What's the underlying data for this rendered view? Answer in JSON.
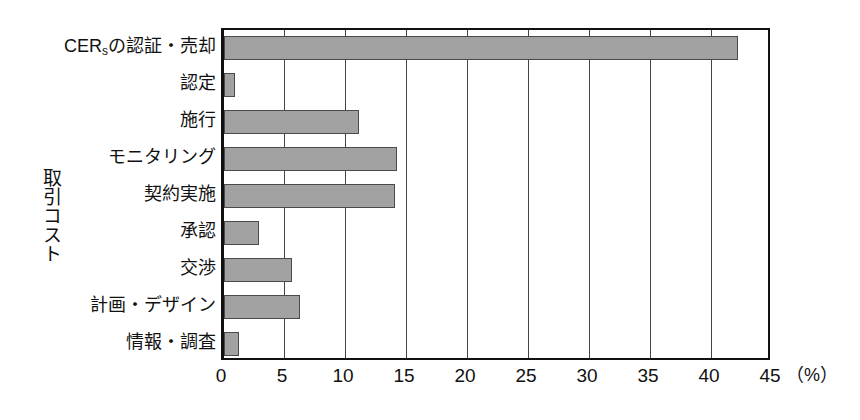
{
  "chart_data": {
    "type": "bar",
    "orientation": "horizontal",
    "title": "",
    "xlabel": "（%）",
    "ylabel": "取引コスト",
    "categories": [
      "CERsの認証・売却",
      "認定",
      "施行",
      "モニタリング",
      "契約実施",
      "承認",
      "交渉",
      "計画・デザイン",
      "情報・調査"
    ],
    "values": [
      42.1,
      0.9,
      11.1,
      14.2,
      14.0,
      2.9,
      5.6,
      6.2,
      1.2
    ],
    "xlim": [
      0,
      45
    ],
    "xticks": [
      0,
      5,
      10,
      15,
      20,
      25,
      30,
      35,
      40,
      45
    ],
    "xtick_labels": [
      "0",
      "5",
      "10",
      "15",
      "20",
      "25",
      "30",
      "35",
      "40",
      "45"
    ],
    "grid": "vertical",
    "legend": "none",
    "bar_color": "#a2a2a2",
    "bar_edge_color": "#4a4a4a",
    "axis_color": "#111111",
    "background_color": "#ffffff"
  },
  "axis": {
    "y_title": "取引コスト",
    "x_unit": "（%）"
  },
  "categories": [
    {
      "label_main": "CER",
      "label_sub": "s",
      "label_tail": "の認証・売却",
      "value": 42.1
    },
    {
      "label_main": "認定",
      "label_sub": "",
      "label_tail": "",
      "value": 0.9
    },
    {
      "label_main": "施行",
      "label_sub": "",
      "label_tail": "",
      "value": 11.1
    },
    {
      "label_main": "モニタリング",
      "label_sub": "",
      "label_tail": "",
      "value": 14.2
    },
    {
      "label_main": "契約実施",
      "label_sub": "",
      "label_tail": "",
      "value": 14.0
    },
    {
      "label_main": "承認",
      "label_sub": "",
      "label_tail": "",
      "value": 2.9
    },
    {
      "label_main": "交渉",
      "label_sub": "",
      "label_tail": "",
      "value": 5.6
    },
    {
      "label_main": "計画・デザイン",
      "label_sub": "",
      "label_tail": "",
      "value": 6.2
    },
    {
      "label_main": "情報・調査",
      "label_sub": "",
      "label_tail": "",
      "value": 1.2
    }
  ]
}
